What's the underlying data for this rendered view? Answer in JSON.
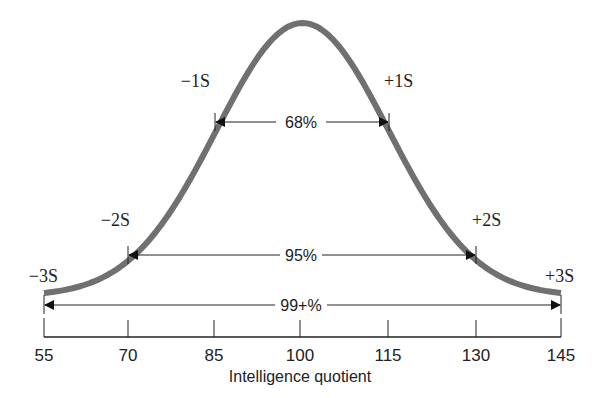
{
  "chart_data": {
    "type": "line",
    "title": "",
    "xlabel": "Intelligence quotient",
    "ylabel": "",
    "x_ticks": [
      "55",
      "70",
      "85",
      "100",
      "115",
      "130",
      "145"
    ],
    "mean": 100,
    "sd": 15,
    "curve": "normal distribution",
    "sd_labels": {
      "m3": "−3S",
      "m2": "−2S",
      "m1": "−1S",
      "p1": "+1S",
      "p2": "+2S",
      "p3": "+3S"
    },
    "intervals": [
      {
        "label": "68%",
        "from": 85,
        "to": 115
      },
      {
        "label": "95%",
        "from": 70,
        "to": 130
      },
      {
        "label": "99+%",
        "from": 55,
        "to": 145
      }
    ],
    "xlim": [
      55,
      145
    ],
    "grid": false,
    "colors": {
      "curve": "#707070",
      "axis": "#222222"
    }
  }
}
